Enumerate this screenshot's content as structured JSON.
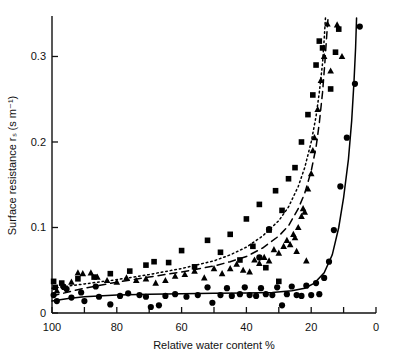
{
  "chart_data": {
    "type": "scatter",
    "title": "",
    "xlabel": "Relative water content %",
    "ylabel": "Surface resistance  rₛ (s m⁻¹)",
    "xlim": [
      100,
      0
    ],
    "ylim": [
      0,
      0.345
    ],
    "x_reversed": true,
    "grid": false,
    "legend": "none",
    "xticks": [
      100,
      90,
      80,
      70,
      60,
      50,
      40,
      30,
      20,
      10,
      0
    ],
    "xtick_labels": [
      "100",
      "",
      "80",
      "",
      "60",
      "",
      "40",
      "",
      "20",
      "",
      "0"
    ],
    "yticks": [
      0,
      0.1,
      0.2,
      0.3
    ],
    "ytick_labels": [
      "0",
      "0.1",
      "0.2",
      "0.3"
    ],
    "series": [
      {
        "name": "circles",
        "marker": "circle",
        "color": "#000000",
        "points": [
          [
            99.5,
            0.021
          ],
          [
            98.5,
            0.014
          ],
          [
            96.5,
            0.031
          ],
          [
            95.5,
            0.028
          ],
          [
            94.0,
            0.018
          ],
          [
            91.0,
            0.024
          ],
          [
            90.0,
            0.014
          ],
          [
            86.5,
            0.031
          ],
          [
            85.5,
            0.019
          ],
          [
            82.0,
            0.01
          ],
          [
            79.0,
            0.02
          ],
          [
            76.5,
            0.023
          ],
          [
            73.0,
            0.021
          ],
          [
            71.0,
            0.019
          ],
          [
            69.5,
            0.007
          ],
          [
            67.0,
            0.009
          ],
          [
            65.0,
            0.02
          ],
          [
            62.0,
            0.022
          ],
          [
            58.5,
            0.019
          ],
          [
            55.0,
            0.021
          ],
          [
            52.0,
            0.03
          ],
          [
            50.5,
            0.012
          ],
          [
            48.0,
            0.021
          ],
          [
            46.0,
            0.029
          ],
          [
            44.5,
            0.02
          ],
          [
            42.0,
            0.022
          ],
          [
            40.5,
            0.03
          ],
          [
            39.0,
            0.021
          ],
          [
            37.0,
            0.02
          ],
          [
            35.5,
            0.029
          ],
          [
            34.0,
            0.022
          ],
          [
            32.0,
            0.021
          ],
          [
            30.5,
            0.03
          ],
          [
            29.0,
            0.009
          ],
          [
            27.5,
            0.022
          ],
          [
            26.0,
            0.031
          ],
          [
            24.5,
            0.021
          ],
          [
            23.0,
            0.02
          ],
          [
            21.5,
            0.032
          ],
          [
            20.0,
            0.021
          ],
          [
            18.5,
            0.035
          ],
          [
            17.5,
            0.022
          ],
          [
            16.0,
            0.041
          ],
          [
            14.5,
            0.06
          ],
          [
            13.0,
            0.097
          ],
          [
            11.0,
            0.148
          ],
          [
            9.0,
            0.205
          ],
          [
            6.5,
            0.268
          ],
          [
            5.0,
            0.335
          ],
          [
            36.0,
            0.065
          ],
          [
            33.0,
            0.098
          ]
        ]
      },
      {
        "name": "triangles",
        "marker": "triangle",
        "color": "#000000",
        "points": [
          [
            98.5,
            0.026
          ],
          [
            96.0,
            0.03
          ],
          [
            94.0,
            0.036
          ],
          [
            92.0,
            0.047
          ],
          [
            90.5,
            0.046
          ],
          [
            88.0,
            0.047
          ],
          [
            86.0,
            0.042
          ],
          [
            83.0,
            0.038
          ],
          [
            80.0,
            0.036
          ],
          [
            77.0,
            0.041
          ],
          [
            74.0,
            0.038
          ],
          [
            71.0,
            0.04
          ],
          [
            68.0,
            0.035
          ],
          [
            65.0,
            0.038
          ],
          [
            62.0,
            0.043
          ],
          [
            59.0,
            0.045
          ],
          [
            56.0,
            0.049
          ],
          [
            53.0,
            0.041
          ],
          [
            50.0,
            0.052
          ],
          [
            47.5,
            0.046
          ],
          [
            45.0,
            0.052
          ],
          [
            43.0,
            0.057
          ],
          [
            41.0,
            0.05
          ],
          [
            39.0,
            0.048
          ],
          [
            37.5,
            0.062
          ],
          [
            36.0,
            0.058
          ],
          [
            34.5,
            0.065
          ],
          [
            33.0,
            0.061
          ],
          [
            31.5,
            0.074
          ],
          [
            30.0,
            0.07
          ],
          [
            28.5,
            0.078
          ],
          [
            27.5,
            0.085
          ],
          [
            26.5,
            0.08
          ],
          [
            25.5,
            0.092
          ],
          [
            25.0,
            0.088
          ],
          [
            24.0,
            0.1
          ],
          [
            23.0,
            0.113
          ],
          [
            22.5,
            0.122
          ],
          [
            22.0,
            0.118
          ],
          [
            21.0,
            0.145
          ],
          [
            20.0,
            0.163
          ],
          [
            19.5,
            0.19
          ],
          [
            19.0,
            0.205
          ],
          [
            18.0,
            0.238
          ],
          [
            17.0,
            0.272
          ],
          [
            16.0,
            0.3
          ],
          [
            15.0,
            0.338
          ],
          [
            14.0,
            0.283
          ],
          [
            12.0,
            0.337
          ],
          [
            10.5,
            0.3
          ],
          [
            24.5,
            0.072
          ],
          [
            21.5,
            0.061
          ]
        ]
      },
      {
        "name": "squares",
        "marker": "square",
        "color": "#000000",
        "points": [
          [
            99.5,
            0.037
          ],
          [
            99.0,
            0.03
          ],
          [
            97.0,
            0.035
          ],
          [
            92.0,
            0.04
          ],
          [
            87.0,
            0.042
          ],
          [
            82.0,
            0.046
          ],
          [
            76.0,
            0.049
          ],
          [
            71.0,
            0.056
          ],
          [
            68.5,
            0.06
          ],
          [
            64.0,
            0.059
          ],
          [
            60.0,
            0.073
          ],
          [
            56.0,
            0.054
          ],
          [
            52.0,
            0.085
          ],
          [
            48.0,
            0.071
          ],
          [
            45.0,
            0.092
          ],
          [
            42.0,
            0.062
          ],
          [
            40.0,
            0.11
          ],
          [
            38.0,
            0.078
          ],
          [
            36.0,
            0.127
          ],
          [
            33.0,
            0.097
          ],
          [
            31.0,
            0.143
          ],
          [
            29.0,
            0.12
          ],
          [
            27.0,
            0.157
          ],
          [
            25.0,
            0.17
          ],
          [
            23.0,
            0.2
          ],
          [
            21.0,
            0.232
          ],
          [
            19.5,
            0.255
          ],
          [
            18.5,
            0.29
          ],
          [
            17.5,
            0.318
          ],
          [
            16.5,
            0.31
          ],
          [
            14.0,
            0.262
          ],
          [
            12.5,
            0.305
          ],
          [
            11.5,
            0.332
          ],
          [
            34.0,
            0.053
          ],
          [
            30.0,
            0.037
          ]
        ]
      }
    ],
    "curves": [
      {
        "name": "dotted-curve",
        "style": "dotted",
        "color": "#000000",
        "points": [
          [
            100,
            0.029
          ],
          [
            90,
            0.034
          ],
          [
            80,
            0.039
          ],
          [
            70,
            0.045
          ],
          [
            60,
            0.052
          ],
          [
            50,
            0.061
          ],
          [
            45,
            0.068
          ],
          [
            40,
            0.077
          ],
          [
            35,
            0.09
          ],
          [
            30,
            0.108
          ],
          [
            27,
            0.124
          ],
          [
            24,
            0.148
          ],
          [
            22,
            0.17
          ],
          [
            20,
            0.2
          ],
          [
            18.5,
            0.23
          ],
          [
            17.5,
            0.258
          ],
          [
            16.5,
            0.292
          ],
          [
            16.0,
            0.32
          ],
          [
            15.6,
            0.345
          ]
        ]
      },
      {
        "name": "dashed-curve",
        "style": "dashed",
        "color": "#000000",
        "points": [
          [
            100,
            0.02
          ],
          [
            90,
            0.029
          ],
          [
            80,
            0.036
          ],
          [
            70,
            0.042
          ],
          [
            60,
            0.048
          ],
          [
            50,
            0.055
          ],
          [
            45,
            0.06
          ],
          [
            40,
            0.066
          ],
          [
            35,
            0.076
          ],
          [
            30,
            0.09
          ],
          [
            27,
            0.102
          ],
          [
            24,
            0.122
          ],
          [
            22,
            0.14
          ],
          [
            20,
            0.166
          ],
          [
            18.5,
            0.194
          ],
          [
            17.5,
            0.222
          ],
          [
            16.5,
            0.258
          ],
          [
            15.8,
            0.292
          ],
          [
            15.2,
            0.325
          ],
          [
            14.8,
            0.345
          ]
        ]
      },
      {
        "name": "solid-curve",
        "style": "solid",
        "color": "#000000",
        "points": [
          [
            100,
            0.014
          ],
          [
            95,
            0.017
          ],
          [
            90,
            0.019
          ],
          [
            80,
            0.021
          ],
          [
            70,
            0.022
          ],
          [
            60,
            0.0225
          ],
          [
            50,
            0.023
          ],
          [
            40,
            0.0235
          ],
          [
            32,
            0.024
          ],
          [
            26,
            0.026
          ],
          [
            22,
            0.029
          ],
          [
            19,
            0.035
          ],
          [
            16,
            0.047
          ],
          [
            13.5,
            0.068
          ],
          [
            11.5,
            0.1
          ],
          [
            10,
            0.135
          ],
          [
            8.5,
            0.18
          ],
          [
            7.5,
            0.225
          ],
          [
            6.8,
            0.27
          ],
          [
            6.3,
            0.31
          ],
          [
            6.0,
            0.345
          ]
        ]
      }
    ]
  }
}
